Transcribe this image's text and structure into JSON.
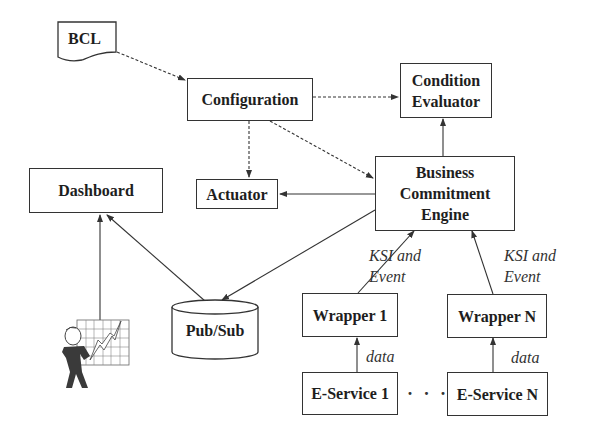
{
  "diagram": {
    "nodes": {
      "bcl": {
        "label": "BCL",
        "shape": "document"
      },
      "configuration": {
        "label": "Configuration"
      },
      "condition_evaluator": {
        "line1": "Condition",
        "line2": "Evaluator"
      },
      "business_commitment_engine": {
        "line1": "Business",
        "line2": "Commitment",
        "line3": "Engine"
      },
      "dashboard": {
        "label": "Dashboard"
      },
      "actuator": {
        "label": "Actuator"
      },
      "pubsub": {
        "label": "Pub/Sub",
        "shape": "cylinder"
      },
      "wrapper_1": {
        "label": "Wrapper 1"
      },
      "wrapper_n": {
        "label": "Wrapper N"
      },
      "eservice_1": {
        "label": "E-Service 1"
      },
      "eservice_n": {
        "label": "E-Service N"
      },
      "user_figure": {
        "icon": "business-person-chart-icon"
      }
    },
    "edge_labels": {
      "ksi_event_1": {
        "line1": "KSI and",
        "line2": "Event"
      },
      "ksi_event_n": {
        "line1": "KSI and",
        "line2": "Event"
      },
      "data_1": "data",
      "data_n": "data"
    },
    "ellipsis": "· · ·",
    "edges": [
      {
        "from": "BCL",
        "to": "Configuration",
        "style": "dashed"
      },
      {
        "from": "Configuration",
        "to": "Condition Evaluator",
        "style": "dashed"
      },
      {
        "from": "Configuration",
        "to": "Actuator",
        "style": "dashed"
      },
      {
        "from": "Configuration",
        "to": "Business Commitment Engine",
        "style": "dashed"
      },
      {
        "from": "Business Commitment Engine",
        "to": "Condition Evaluator",
        "style": "solid"
      },
      {
        "from": "Business Commitment Engine",
        "to": "Actuator",
        "style": "solid"
      },
      {
        "from": "Business Commitment Engine",
        "to": "Pub/Sub",
        "style": "solid"
      },
      {
        "from": "Pub/Sub",
        "to": "Dashboard",
        "style": "solid"
      },
      {
        "from": "User",
        "to": "Dashboard",
        "style": "solid"
      },
      {
        "from": "Wrapper 1",
        "to": "Business Commitment Engine",
        "style": "solid",
        "label": "KSI and Event"
      },
      {
        "from": "Wrapper N",
        "to": "Business Commitment Engine",
        "style": "solid",
        "label": "KSI and Event"
      },
      {
        "from": "E-Service 1",
        "to": "Wrapper 1",
        "style": "solid",
        "label": "data"
      },
      {
        "from": "E-Service N",
        "to": "Wrapper N",
        "style": "solid",
        "label": "data"
      }
    ]
  }
}
